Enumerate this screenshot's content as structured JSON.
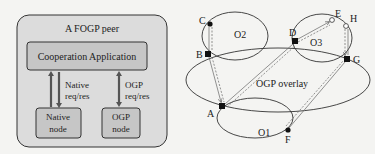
{
  "left": {
    "peer_title": "A FOGP peer",
    "app_box": "Cooperation Application",
    "native_link": [
      "Native",
      "req/res"
    ],
    "ogp_link": [
      "OGP",
      "req/res"
    ],
    "native_node": [
      "Native",
      "node"
    ],
    "ogp_node": [
      "OGP",
      "node"
    ]
  },
  "right": {
    "overlay_label": "OGP overlay",
    "clusters": {
      "o1": "O1",
      "o2": "O2",
      "o3": "O3"
    },
    "nodes": {
      "a": "A",
      "b": "B",
      "c": "C",
      "d": "D",
      "e": "E",
      "f": "F",
      "g": "G",
      "h": "H"
    }
  },
  "colors": {
    "box_fill": "#d9d9d9",
    "inner_fill": "#c4c4c4",
    "stroke": "#333333",
    "background": "#f4f4f2"
  }
}
